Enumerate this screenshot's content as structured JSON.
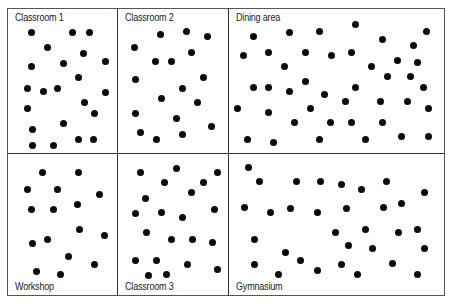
{
  "diagram": {
    "title": "",
    "panels": [
      {
        "label": "Classroom 1",
        "label_pos": "top",
        "box": [
          7,
          8,
          117,
          153
        ],
        "dots": [
          [
            31,
            32
          ],
          [
            72,
            32
          ],
          [
            89,
            32
          ],
          [
            47,
            47
          ],
          [
            83,
            53
          ],
          [
            31,
            66
          ],
          [
            63,
            63
          ],
          [
            105,
            61
          ],
          [
            78,
            77
          ],
          [
            27,
            88
          ],
          [
            43,
            91
          ],
          [
            57,
            88
          ],
          [
            105,
            92
          ],
          [
            27,
            108
          ],
          [
            84,
            102
          ],
          [
            94,
            113
          ],
          [
            32,
            129
          ],
          [
            63,
            123
          ],
          [
            32,
            145
          ],
          [
            53,
            145
          ],
          [
            78,
            139
          ],
          [
            93,
            139
          ]
        ]
      },
      {
        "label": "Classroom 2",
        "label_pos": "top",
        "box": [
          117,
          8,
          228,
          153
        ],
        "dots": [
          [
            160,
            34
          ],
          [
            186,
            31
          ],
          [
            207,
            36
          ],
          [
            134,
            47
          ],
          [
            191,
            52
          ],
          [
            155,
            61
          ],
          [
            171,
            61
          ],
          [
            135,
            79
          ],
          [
            203,
            77
          ],
          [
            182,
            88
          ],
          [
            161,
            98
          ],
          [
            197,
            102
          ],
          [
            135,
            113
          ],
          [
            176,
            118
          ],
          [
            211,
            126
          ],
          [
            140,
            132
          ],
          [
            156,
            139
          ],
          [
            182,
            134
          ]
        ]
      },
      {
        "label": "Dining area",
        "label_pos": "top",
        "box": [
          228,
          8,
          445,
          153
        ],
        "dots": [
          [
            355,
            24
          ],
          [
            253,
            36
          ],
          [
            289,
            32
          ],
          [
            319,
            31
          ],
          [
            382,
            39
          ],
          [
            426,
            31
          ],
          [
            243,
            55
          ],
          [
            268,
            52
          ],
          [
            305,
            52
          ],
          [
            331,
            55
          ],
          [
            351,
            52
          ],
          [
            413,
            45
          ],
          [
            284,
            66
          ],
          [
            371,
            66
          ],
          [
            397,
            60
          ],
          [
            417,
            62
          ],
          [
            253,
            87
          ],
          [
            268,
            87
          ],
          [
            289,
            91
          ],
          [
            305,
            81
          ],
          [
            324,
            94
          ],
          [
            355,
            87
          ],
          [
            387,
            76
          ],
          [
            410,
            76
          ],
          [
            423,
            87
          ],
          [
            237,
            108
          ],
          [
            268,
            112
          ],
          [
            310,
            108
          ],
          [
            345,
            101
          ],
          [
            380,
            101
          ],
          [
            407,
            101
          ],
          [
            428,
            108
          ],
          [
            294,
            122
          ],
          [
            330,
            122
          ],
          [
            351,
            122
          ],
          [
            382,
            122
          ],
          [
            247,
            139
          ],
          [
            273,
            142
          ],
          [
            319,
            139
          ],
          [
            365,
            139
          ],
          [
            401,
            136
          ],
          [
            428,
            136
          ]
        ]
      },
      {
        "label": "Workshop",
        "label_pos": "bottom",
        "box": [
          7,
          153,
          117,
          296
        ],
        "dots": [
          [
            42,
            172
          ],
          [
            78,
            172
          ],
          [
            27,
            189
          ],
          [
            57,
            189
          ],
          [
            99,
            194
          ],
          [
            31,
            209
          ],
          [
            53,
            209
          ],
          [
            77,
            204
          ],
          [
            79,
            229
          ],
          [
            104,
            235
          ],
          [
            32,
            243
          ],
          [
            47,
            239
          ],
          [
            68,
            256
          ],
          [
            94,
            264
          ],
          [
            36,
            271
          ],
          [
            60,
            274
          ]
        ]
      },
      {
        "label": "Classroom 3",
        "label_pos": "bottom",
        "box": [
          117,
          153,
          228,
          296
        ],
        "dots": [
          [
            140,
            172
          ],
          [
            176,
            168
          ],
          [
            217,
            172
          ],
          [
            164,
            182
          ],
          [
            203,
            182
          ],
          [
            191,
            192
          ],
          [
            145,
            198
          ],
          [
            135,
            213
          ],
          [
            161,
            212
          ],
          [
            182,
            217
          ],
          [
            214,
            209
          ],
          [
            146,
            232
          ],
          [
            171,
            239
          ],
          [
            192,
            239
          ],
          [
            212,
            242
          ],
          [
            135,
            260
          ],
          [
            156,
            260
          ],
          [
            187,
            264
          ],
          [
            217,
            269
          ],
          [
            148,
            275
          ],
          [
            166,
            274
          ]
        ]
      },
      {
        "label": "Gymnasium",
        "label_pos": "bottom",
        "box": [
          228,
          153,
          445,
          296
        ],
        "dots": [
          [
            248,
            167
          ],
          [
            259,
            181
          ],
          [
            296,
            181
          ],
          [
            320,
            181
          ],
          [
            341,
            184
          ],
          [
            361,
            189
          ],
          [
            386,
            181
          ],
          [
            424,
            192
          ],
          [
            244,
            207
          ],
          [
            270,
            212
          ],
          [
            290,
            208
          ],
          [
            317,
            212
          ],
          [
            346,
            208
          ],
          [
            383,
            207
          ],
          [
            401,
            203
          ],
          [
            254,
            239
          ],
          [
            335,
            232
          ],
          [
            365,
            229
          ],
          [
            398,
            232
          ],
          [
            417,
            229
          ],
          [
            348,
            245
          ],
          [
            372,
            248
          ],
          [
            424,
            248
          ],
          [
            285,
            252
          ],
          [
            300,
            260
          ],
          [
            254,
            264
          ],
          [
            341,
            264
          ],
          [
            392,
            263
          ],
          [
            278,
            274
          ],
          [
            317,
            270
          ],
          [
            357,
            274
          ],
          [
            417,
            274
          ]
        ]
      }
    ]
  }
}
